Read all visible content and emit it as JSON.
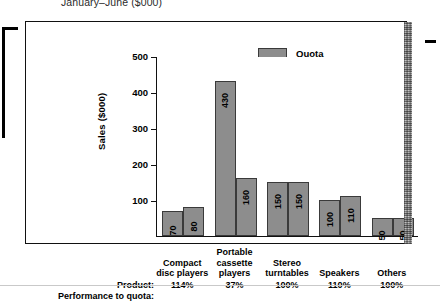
{
  "chart_data": {
    "type": "bar",
    "title": "January–June ($000)",
    "ylabel": "Sales ($000)",
    "xlabel": "",
    "ylim": [
      0,
      500
    ],
    "yticks": [
      100,
      200,
      300,
      400,
      500
    ],
    "grid": false,
    "legend_position": "top-center",
    "categories": [
      "Compact disc players",
      "Portable cassette players",
      "Stereo turntables",
      "Speakers",
      "Others"
    ],
    "series": [
      {
        "name": "Quota",
        "values": [
          70,
          430,
          150,
          100,
          50
        ]
      },
      {
        "name": "Actual",
        "values": [
          80,
          160,
          150,
          110,
          50
        ]
      }
    ],
    "annotations": {
      "row_label_product": "Product:",
      "row_label_performance": "Performance to quota:",
      "performance_to_quota": [
        "114%",
        "37%",
        "100%",
        "110%",
        "100%"
      ]
    },
    "colors": {
      "bar_fill": "#8d8d8d",
      "bar_border": "#3a3a3a",
      "axis": "#111111",
      "text": "#000000",
      "background": "#ffffff"
    }
  },
  "legend": [
    {
      "label": "Quota"
    },
    {
      "label": "Actual"
    }
  ],
  "axis": {
    "y_title": "Sales ($000)",
    "y_ticks": [
      "500",
      "400",
      "300",
      "200",
      "100"
    ]
  },
  "columns": [
    {
      "name_line1": "Compact",
      "name_line2": "disc players",
      "name_line3": "",
      "pct": "114%"
    },
    {
      "name_line1": "Portable",
      "name_line2": "cassette",
      "name_line3": "players",
      "pct": "37%"
    },
    {
      "name_line1": "Stereo",
      "name_line2": "turntables",
      "name_line3": "",
      "pct": "100%"
    },
    {
      "name_line1": "Speakers",
      "name_line2": "",
      "name_line3": "",
      "pct": "110%"
    },
    {
      "name_line1": "Others",
      "name_line2": "",
      "name_line3": "",
      "pct": "100%"
    }
  ],
  "row_labels": {
    "product": "Product:",
    "performance": "Performance to quota:"
  },
  "title": "January–June ($000)"
}
